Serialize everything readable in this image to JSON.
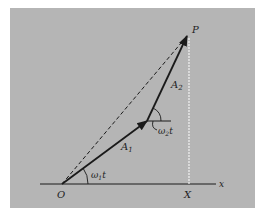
{
  "figure": {
    "background_color": "#b5b5b5",
    "line_color": "#1a1a1a",
    "projection_color": "#f2f2f2",
    "points": {
      "origin": {
        "label": "O",
        "x": 62,
        "y": 184
      },
      "tip_a1": {
        "x": 147,
        "y": 121
      },
      "p": {
        "label": "P",
        "x": 187,
        "y": 36
      },
      "x_foot": {
        "label": "X",
        "x": 189,
        "y": 184
      }
    },
    "labels": {
      "p": "P",
      "a2": "A",
      "a2_sub": "2",
      "a1": "A",
      "a1_sub": "1",
      "omega2t": "ω",
      "omega2t_sub": "2",
      "omega2t_t": "t",
      "omega1t": "ω",
      "omega1t_sub": "1",
      "omega1t_t": "t",
      "origin": "O",
      "x_foot": "X",
      "x_axis": "x"
    }
  }
}
